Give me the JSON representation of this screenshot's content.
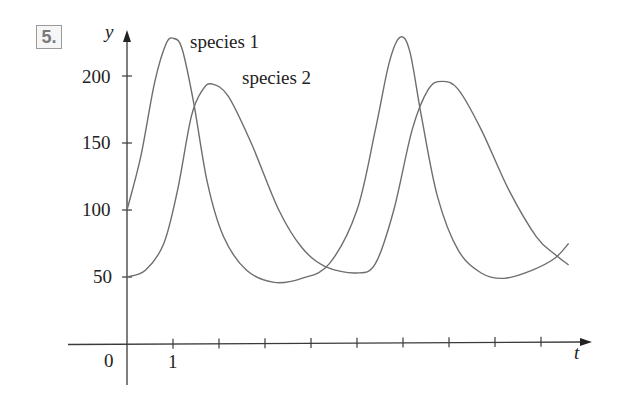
{
  "problem_number": "5.",
  "chart_data": {
    "type": "line",
    "title": "",
    "xlabel": "t",
    "ylabel": "y",
    "xlim": [
      0,
      10
    ],
    "ylim": [
      0,
      240
    ],
    "x_ticks": [
      1,
      2,
      3,
      4,
      5,
      6,
      7,
      8,
      9
    ],
    "x_tick_labels": [
      "0",
      "1"
    ],
    "y_ticks": [
      50,
      100,
      150,
      200
    ],
    "y_tick_labels": [
      "50",
      "100",
      "150",
      "200"
    ],
    "grid": false,
    "legend": "inline annotations",
    "series": [
      {
        "name": "species 1",
        "points": [
          [
            0,
            100
          ],
          [
            0.3,
            140
          ],
          [
            0.6,
            195
          ],
          [
            0.85,
            224
          ],
          [
            1.02,
            228
          ],
          [
            1.2,
            220
          ],
          [
            1.45,
            180
          ],
          [
            1.75,
            120
          ],
          [
            2.1,
            80
          ],
          [
            2.6,
            55
          ],
          [
            3.2,
            46
          ],
          [
            3.8,
            49
          ],
          [
            4.4,
            60
          ],
          [
            5.0,
            100
          ],
          [
            5.4,
            160
          ],
          [
            5.7,
            210
          ],
          [
            5.94,
            229
          ],
          [
            6.15,
            218
          ],
          [
            6.4,
            170
          ],
          [
            6.75,
            110
          ],
          [
            7.2,
            70
          ],
          [
            7.7,
            53
          ],
          [
            8.2,
            49
          ],
          [
            8.8,
            55
          ],
          [
            9.3,
            64
          ],
          [
            9.6,
            75
          ]
        ]
      },
      {
        "name": "species 2",
        "points": [
          [
            0,
            50
          ],
          [
            0.4,
            55
          ],
          [
            0.8,
            75
          ],
          [
            1.1,
            115
          ],
          [
            1.4,
            170
          ],
          [
            1.65,
            190
          ],
          [
            1.85,
            194
          ],
          [
            2.2,
            185
          ],
          [
            2.7,
            150
          ],
          [
            3.3,
            100
          ],
          [
            3.8,
            72
          ],
          [
            4.3,
            58
          ],
          [
            4.98,
            53
          ],
          [
            5.4,
            60
          ],
          [
            5.8,
            100
          ],
          [
            6.2,
            160
          ],
          [
            6.55,
            190
          ],
          [
            6.85,
            196
          ],
          [
            7.2,
            190
          ],
          [
            7.7,
            160
          ],
          [
            8.3,
            115
          ],
          [
            8.9,
            80
          ],
          [
            9.3,
            67
          ],
          [
            9.6,
            59
          ]
        ]
      }
    ],
    "annotations": [
      {
        "text": "species 1",
        "t": 1.3,
        "y": 225
      },
      {
        "text": "species 2",
        "t": 2.5,
        "y": 195
      }
    ]
  },
  "labels": {
    "y_axis": "y",
    "x_axis": "t",
    "origin": "0",
    "x_one": "1",
    "y50": "50",
    "y100": "100",
    "y150": "150",
    "y200": "200",
    "species1": "species 1",
    "species2": "species 2"
  }
}
